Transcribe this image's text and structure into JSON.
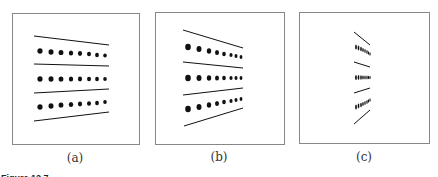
{
  "figure": {
    "caption_prefix": "Figure 12.7",
    "panels": [
      {
        "id": "a",
        "label": "(a)",
        "box": [
          12,
          13,
          128,
          132
        ]
      },
      {
        "id": "b",
        "label": "(b)",
        "box": [
          156,
          12,
          129,
          132
        ]
      },
      {
        "id": "c",
        "label": "(c)",
        "box": [
          299,
          12,
          131,
          132
        ]
      }
    ]
  },
  "colors": {
    "frame": "#888888",
    "ink": "#111111",
    "background": "#ffffff"
  }
}
